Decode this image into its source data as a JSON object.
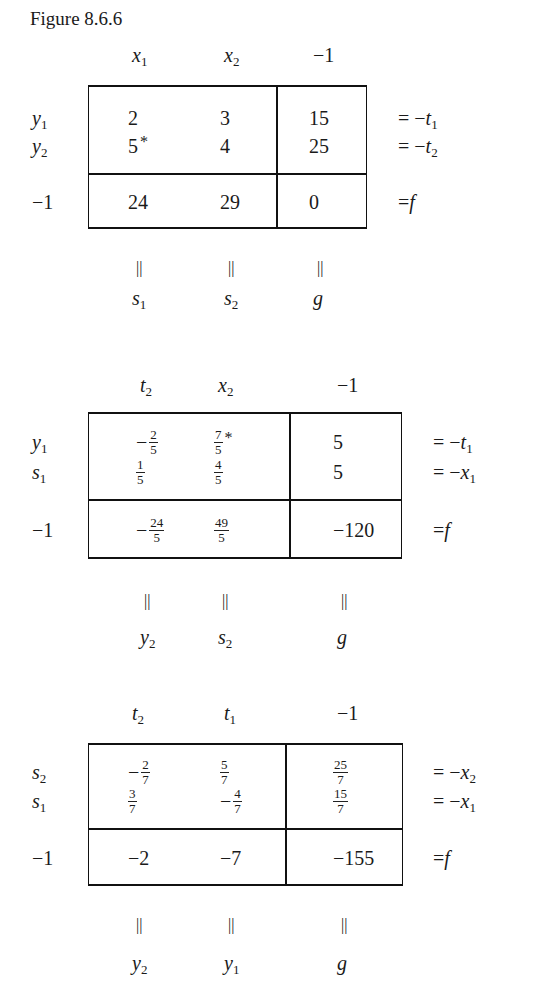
{
  "caption": "Figure 8.6.6",
  "tableaux": [
    {
      "col_headers": [
        {
          "v": "x",
          "s": "1"
        },
        {
          "v": "x",
          "s": "2"
        },
        {
          "v": "−1",
          "s": ""
        }
      ],
      "row_labels": [
        {
          "v": "y",
          "s": "1"
        },
        {
          "v": "y",
          "s": "2"
        },
        {
          "v": "−1",
          "s": ""
        }
      ],
      "cells": [
        [
          {
            "text": "2"
          },
          {
            "text": "3"
          },
          {
            "text": "15"
          }
        ],
        [
          {
            "text": "5",
            "star": "*"
          },
          {
            "text": "4"
          },
          {
            "text": "25"
          }
        ],
        [
          {
            "text": "24"
          },
          {
            "text": "29"
          },
          {
            "text": "0"
          }
        ]
      ],
      "right_eqs": [
        {
          "eq": "= −",
          "v": "t",
          "s": "1"
        },
        {
          "eq": "= −",
          "v": "t",
          "s": "2"
        },
        {
          "eq": "=",
          "v": "f",
          "s": ""
        }
      ],
      "bottom_eq": "||",
      "bottom_labels": [
        {
          "v": "s",
          "s": "1"
        },
        {
          "v": "s",
          "s": "2"
        },
        {
          "v": "g",
          "s": ""
        }
      ]
    },
    {
      "col_headers": [
        {
          "v": "t",
          "s": "2"
        },
        {
          "v": "x",
          "s": "2"
        },
        {
          "v": "−1",
          "s": ""
        }
      ],
      "row_labels": [
        {
          "v": "y",
          "s": "1"
        },
        {
          "v": "s",
          "s": "1"
        },
        {
          "v": "−1",
          "s": ""
        }
      ],
      "cells": [
        [
          {
            "sign": "−",
            "num": "2",
            "den": "5"
          },
          {
            "num": "7",
            "den": "5",
            "star": "*"
          },
          {
            "text": "5"
          }
        ],
        [
          {
            "num": "1",
            "den": "5"
          },
          {
            "num": "4",
            "den": "5"
          },
          {
            "text": "5"
          }
        ],
        [
          {
            "sign": "−",
            "num": "24",
            "den": "5"
          },
          {
            "num": "49",
            "den": "5"
          },
          {
            "text": "−120"
          }
        ]
      ],
      "right_eqs": [
        {
          "eq": "= −",
          "v": "t",
          "s": "1"
        },
        {
          "eq": "= −",
          "v": "x",
          "s": "1"
        },
        {
          "eq": "=",
          "v": "f",
          "s": ""
        }
      ],
      "bottom_eq": "||",
      "bottom_labels": [
        {
          "v": "y",
          "s": "2"
        },
        {
          "v": "s",
          "s": "2"
        },
        {
          "v": "g",
          "s": ""
        }
      ]
    },
    {
      "col_headers": [
        {
          "v": "t",
          "s": "2"
        },
        {
          "v": "t",
          "s": "1"
        },
        {
          "v": "−1",
          "s": ""
        }
      ],
      "row_labels": [
        {
          "v": "s",
          "s": "2"
        },
        {
          "v": "s",
          "s": "1"
        },
        {
          "v": "−1",
          "s": ""
        }
      ],
      "cells": [
        [
          {
            "sign": "−",
            "num": "2",
            "den": "7"
          },
          {
            "num": "5",
            "den": "7"
          },
          {
            "num": "25",
            "den": "7"
          }
        ],
        [
          {
            "num": "3",
            "den": "7"
          },
          {
            "sign": "−",
            "num": "4",
            "den": "7"
          },
          {
            "num": "15",
            "den": "7"
          }
        ],
        [
          {
            "text": "−2"
          },
          {
            "text": "−7"
          },
          {
            "text": "−155"
          }
        ]
      ],
      "right_eqs": [
        {
          "eq": "= −",
          "v": "x",
          "s": "2"
        },
        {
          "eq": "= −",
          "v": "x",
          "s": "1"
        },
        {
          "eq": "=",
          "v": "f",
          "s": ""
        }
      ],
      "bottom_eq": "||",
      "bottom_labels": [
        {
          "v": "y",
          "s": "2"
        },
        {
          "v": "y",
          "s": "1"
        },
        {
          "v": "g",
          "s": ""
        }
      ]
    }
  ]
}
